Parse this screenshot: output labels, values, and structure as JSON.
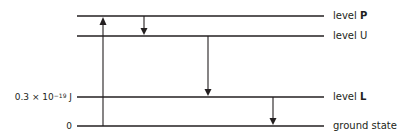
{
  "diagram": {
    "levels": [
      {
        "id": "P",
        "prefix": "level ",
        "name": "P",
        "bold": true,
        "y": 16
      },
      {
        "id": "U",
        "prefix": "level ",
        "name": "U",
        "bold": false,
        "y": 36
      },
      {
        "id": "L",
        "prefix": "level ",
        "name": "L",
        "bold": true,
        "y": 97
      },
      {
        "id": "ground",
        "prefix": "",
        "name": "ground state",
        "bold": false,
        "y": 126
      }
    ],
    "energy_labels": {
      "L": {
        "mantissa": "0.3 × 10",
        "exponent": "−19",
        "unit": " J"
      },
      "ground": "0"
    },
    "transitions": [
      {
        "from": "ground",
        "to": "P",
        "direction": "up",
        "x": 103
      },
      {
        "from": "P",
        "to": "U",
        "direction": "down",
        "x": 144
      },
      {
        "from": "U",
        "to": "L",
        "direction": "down",
        "x": 208
      },
      {
        "from": "L",
        "to": "ground",
        "direction": "down",
        "x": 273
      }
    ]
  }
}
